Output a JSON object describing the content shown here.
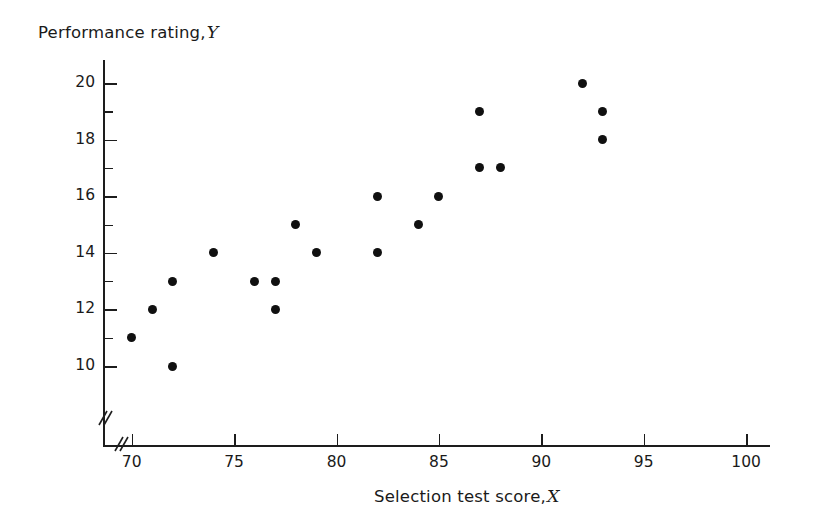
{
  "chart_data": {
    "type": "scatter",
    "title": "",
    "xlabel": "Selection test score, X",
    "ylabel": "Performance rating, Y",
    "xlabel_text": "Selection test score,",
    "xlabel_var": "X",
    "ylabel_text": "Performance rating,",
    "ylabel_var": "Y",
    "xlim": [
      68,
      102
    ],
    "ylim": [
      9,
      21
    ],
    "x_major_ticks": [
      70,
      75,
      80,
      85,
      90,
      95,
      100
    ],
    "x_tick_labels": [
      "70",
      "75",
      "80",
      "85",
      "90",
      "95",
      "100"
    ],
    "y_major_ticks": [
      10,
      12,
      14,
      16,
      18,
      20
    ],
    "y_tick_labels": [
      "10",
      "12",
      "14",
      "16",
      "18",
      "20"
    ],
    "y_minor_ticks": [
      11,
      13,
      15,
      17,
      19
    ],
    "grid": false,
    "legend": false,
    "axis_break_x": true,
    "axis_break_y": true,
    "marker": "filled-circle",
    "marker_color": "#101010",
    "axis_color": "#1d1d1d",
    "background_color": "#ffffff",
    "n_points": 20,
    "x": [
      70,
      71,
      72,
      72,
      74,
      76,
      77,
      77,
      78,
      79,
      82,
      82,
      84,
      85,
      87,
      87,
      88,
      92,
      93,
      93
    ],
    "y": [
      11,
      12,
      13,
      10,
      14,
      13,
      13,
      12,
      15,
      14,
      16,
      14,
      15,
      16,
      19,
      17,
      17,
      20,
      19,
      18
    ],
    "points": [
      {
        "x": 70,
        "y": 11
      },
      {
        "x": 71,
        "y": 12
      },
      {
        "x": 72,
        "y": 13
      },
      {
        "x": 72,
        "y": 10
      },
      {
        "x": 74,
        "y": 14
      },
      {
        "x": 76,
        "y": 13
      },
      {
        "x": 77,
        "y": 13
      },
      {
        "x": 77,
        "y": 12
      },
      {
        "x": 78,
        "y": 15
      },
      {
        "x": 79,
        "y": 14
      },
      {
        "x": 82,
        "y": 16
      },
      {
        "x": 82,
        "y": 14
      },
      {
        "x": 84,
        "y": 15
      },
      {
        "x": 85,
        "y": 16
      },
      {
        "x": 87,
        "y": 19
      },
      {
        "x": 87,
        "y": 17
      },
      {
        "x": 88,
        "y": 17
      },
      {
        "x": 92,
        "y": 20
      },
      {
        "x": 93,
        "y": 19
      },
      {
        "x": 93,
        "y": 18
      }
    ]
  },
  "geometry": {
    "x_origin_px": 131.7,
    "x_px_per_unit": 20.48,
    "y_origin_px": 366,
    "y_px_per_unit": 28.3
  }
}
